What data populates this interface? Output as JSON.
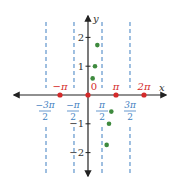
{
  "chart_data": {
    "type": "scatter",
    "title": "",
    "xlabel": "x",
    "ylabel": "y",
    "xlim": [
      -5.4,
      7.2
    ],
    "ylim": [
      -2.7,
      2.7
    ],
    "grid": false,
    "asymptotes": {
      "values": [
        -4.712,
        -1.571,
        1.571,
        4.712
      ],
      "labels": [
        {
          "num": "−3π",
          "den": "2"
        },
        {
          "num": "−π",
          "den": "2"
        },
        {
          "num": "π",
          "den": "2"
        },
        {
          "num": "3π",
          "den": "2"
        }
      ],
      "color": "#3f7fc1",
      "style": "dashed"
    },
    "zeros": {
      "x": [
        -3.1416,
        0,
        3.1416,
        6.2832
      ],
      "labels": [
        "−π",
        "0",
        "π",
        "2π"
      ],
      "color": "#d42a2a"
    },
    "y_ticks": {
      "values": [
        2,
        1,
        -1,
        -2
      ],
      "labels": [
        "2",
        "1",
        "−1",
        "−2"
      ]
    },
    "series": [
      {
        "name": "points",
        "color": "#3e8a3e",
        "points": [
          {
            "x": 0.5236,
            "y": 0.577
          },
          {
            "x": 0.7854,
            "y": 1.0
          },
          {
            "x": 1.0472,
            "y": 1.732
          },
          {
            "x": 2.0944,
            "y": -1.732
          },
          {
            "x": 2.3562,
            "y": -1.0
          },
          {
            "x": 2.618,
            "y": -0.577
          }
        ]
      }
    ]
  }
}
